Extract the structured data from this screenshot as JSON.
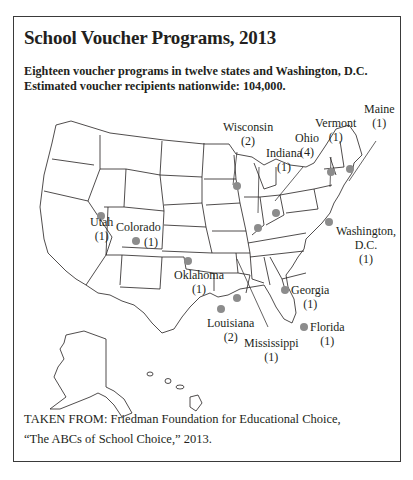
{
  "header": {
    "title": "School Voucher Programs, 2013",
    "subtitle_line1": "Eighteen voucher programs in twelve states and Washington, D.C.",
    "subtitle_line2": "Estimated voucher recipients nationwide: 104,000."
  },
  "map": {
    "marker_color": "#8c8c8c",
    "outline_color": "#231f20",
    "states": [
      {
        "name": "Utah",
        "count": "(1)"
      },
      {
        "name": "Colorado",
        "count": "(1)"
      },
      {
        "name": "Oklahoma",
        "count": "(1)"
      },
      {
        "name": "Louisiana",
        "count": "(2)"
      },
      {
        "name": "Mississippi",
        "count": "(1)"
      },
      {
        "name": "Wisconsin",
        "count": "(2)"
      },
      {
        "name": "Indiana",
        "count": "(1)"
      },
      {
        "name": "Ohio",
        "count": "(4)"
      },
      {
        "name": "Vermont",
        "count": "(1)"
      },
      {
        "name": "Maine",
        "count": "(1)"
      },
      {
        "name": "Washington,",
        "name2": "D.C.",
        "count": "(1)"
      },
      {
        "name": "Georgia",
        "count": "(1)"
      },
      {
        "name": "Florida",
        "count": "(1)"
      }
    ]
  },
  "source": {
    "line1": "TAKEN FROM: Friedman Foundation for Educational Choice,",
    "line2": "“The ABCs of School Choice,” 2013."
  }
}
